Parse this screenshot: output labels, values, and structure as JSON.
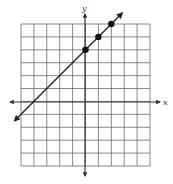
{
  "graph": {
    "x_label": "x",
    "y_label": "y",
    "x_range": [
      -5,
      5
    ],
    "y_range": [
      -5,
      6
    ],
    "grid_color": "#555555",
    "axis_color": "#333333",
    "line_color": "#222222",
    "point_color": "#111111"
  },
  "chart_data": {
    "type": "line",
    "title": "",
    "xlabel": "x",
    "ylabel": "y",
    "xlim": [
      -5,
      5
    ],
    "ylim": [
      -5,
      6
    ],
    "grid": true,
    "line": {
      "equation": "y = x + 4",
      "slope": 1,
      "intercept": 4,
      "arrows_both_ends": true
    },
    "points": [
      {
        "x": 0,
        "y": 4
      },
      {
        "x": 1,
        "y": 5
      },
      {
        "x": 2,
        "y": 6
      }
    ]
  }
}
